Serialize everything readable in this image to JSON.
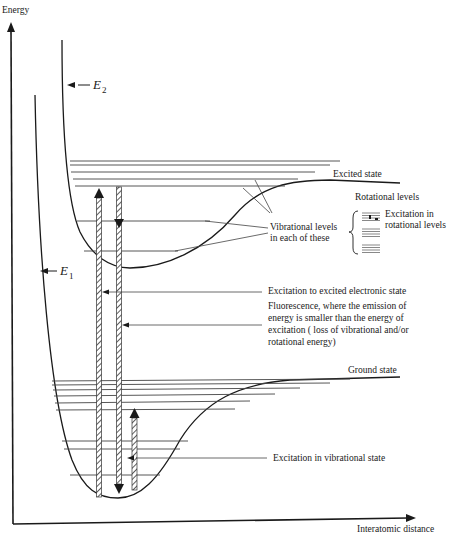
{
  "axes": {
    "y_label": "Energy",
    "x_label": "Interatomic distance"
  },
  "curves": {
    "upper": {
      "symbol": "E",
      "subscript": "2",
      "plateau_label": "Excited state"
    },
    "lower": {
      "symbol": "E",
      "subscript": "1",
      "plateau_label": "Ground state"
    }
  },
  "annotations": {
    "vibrational_levels": [
      "Vibrational levels",
      "in each of these"
    ],
    "rotational_title": "Rotational levels",
    "rotational_excitation": [
      "Excitation in",
      "rotational levels"
    ],
    "excitation_electronic": "Excitation to excited electronic state",
    "fluorescence": [
      "Fluorescence, where the emission of",
      "energy is smaller than the energy of",
      "excitation ( loss of vibrational and/or",
      "rotational energy)"
    ],
    "excitation_vibrational": "Excitation in vibrational state"
  },
  "colors": {
    "ink": "#1a1a1a",
    "light_ink": "#555555",
    "background": "#ffffff"
  }
}
